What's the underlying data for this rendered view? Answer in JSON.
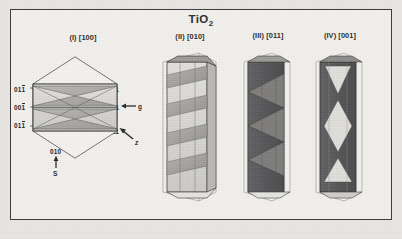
{
  "figure": {
    "title_main": "TiO",
    "title_sub": "2",
    "panels": [
      {
        "id": "I",
        "roman": "(I)",
        "direction": "[100]",
        "label": "(I) [100]",
        "shape": "hexagonal-outline-with-crossed-bands"
      },
      {
        "id": "II",
        "roman": "(II)",
        "direction": "[010]",
        "label": "(II) [010]",
        "shape": "hexagonal-prism-zigzag-bands"
      },
      {
        "id": "III",
        "roman": "(III)",
        "direction": "[011]",
        "label": "(III) [011]",
        "shape": "prism-with-bowtie-facets"
      },
      {
        "id": "IV",
        "roman": "(IV)",
        "direction": "[001]",
        "label": "(IV) [001]",
        "shape": "dark-prism-light-diamonds"
      }
    ],
    "miller_left": [
      {
        "text": "011",
        "overbar_last": true
      },
      {
        "text": "001",
        "overbar_last": true
      },
      {
        "text": "011",
        "overbar_last": true
      }
    ],
    "miller_right": [
      {
        "text": "011",
        "overbar_last": false
      },
      {
        "text": "001",
        "overbar_last": false
      },
      {
        "text": "011",
        "overbar_last": false
      }
    ],
    "miller_bottom": {
      "text": "010",
      "overbar_last": false
    },
    "vector_g": "g",
    "vector_z": "z",
    "vector_s": "S",
    "colors": {
      "frame": "#3a3a3a",
      "paper": "#f2f1ee",
      "page": "#e8e7e4",
      "ink": "#242424",
      "fill_light": "#d8d7d3",
      "fill_mid": "#a9a8a4",
      "fill_dark": "#58585a"
    }
  }
}
